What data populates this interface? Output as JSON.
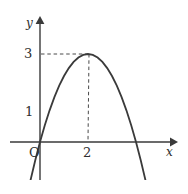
{
  "figure": {
    "background_color": "#ffffff",
    "stroke_color": "#3a3a3a",
    "text_color": "#2e2e2e",
    "width": 188,
    "height": 193
  },
  "labels": {
    "y_axis": "y",
    "x_axis": "x",
    "origin": "O",
    "tick_y_3": "3",
    "tick_y_1": "1",
    "tick_x_2": "2"
  },
  "chart_data": {
    "type": "line",
    "title": "",
    "subtitle": "",
    "xlabel": "x",
    "ylabel": "y",
    "grid": false,
    "legend": null,
    "legend_position": "none",
    "xlim": [
      -1.25,
      5.65
    ],
    "ylim": [
      -1.0,
      4.3
    ],
    "xticks": [
      2
    ],
    "xtick_labels": [
      "2"
    ],
    "yticks": [
      1,
      3
    ],
    "ytick_labels": [
      "1",
      "3"
    ],
    "origin_label": "O",
    "axes": {
      "x_axis_arrow": true,
      "y_axis_arrow": true,
      "x_axis_y_value": 0,
      "y_axis_x_value": 0
    },
    "series": [
      {
        "name": "parabola",
        "type": "line",
        "style": "solid",
        "equation": "y = -0.75(x - 2)^2 + 3",
        "vertex": [
          2,
          3
        ],
        "y_intercept": [
          0,
          1
        ],
        "x_intercepts": [
          -0.58,
          4.58
        ],
        "x": [
          -0.8,
          -0.6,
          -0.4,
          -0.2,
          0,
          0.2,
          0.4,
          0.6,
          0.8,
          1.0,
          1.2,
          1.4,
          1.6,
          1.8,
          2.0,
          2.2,
          2.4,
          2.6,
          2.8,
          3.0,
          3.2,
          3.4,
          3.6,
          3.8,
          4.0,
          4.2,
          4.4,
          4.6,
          4.8,
          5.0,
          5.05
        ],
        "y": [
          -2.88,
          -2.07,
          -1.32,
          -0.63,
          0,
          0.57,
          1.08,
          1.53,
          1.92,
          2.25,
          2.52,
          2.73,
          2.88,
          2.97,
          3.0,
          2.97,
          2.88,
          2.73,
          2.52,
          2.25,
          1.92,
          1.53,
          1.08,
          0.57,
          0,
          -0.63,
          -1.32,
          -2.07,
          -2.88,
          -3.75,
          -3.98
        ]
      }
    ],
    "annotations": [
      {
        "name": "vertex-horizontal-dashed",
        "style": "dashed",
        "from": [
          0,
          3
        ],
        "to": [
          2,
          3
        ]
      },
      {
        "name": "vertex-vertical-dashed",
        "style": "dashed",
        "from": [
          2,
          3
        ],
        "to": [
          2,
          0
        ]
      }
    ]
  }
}
